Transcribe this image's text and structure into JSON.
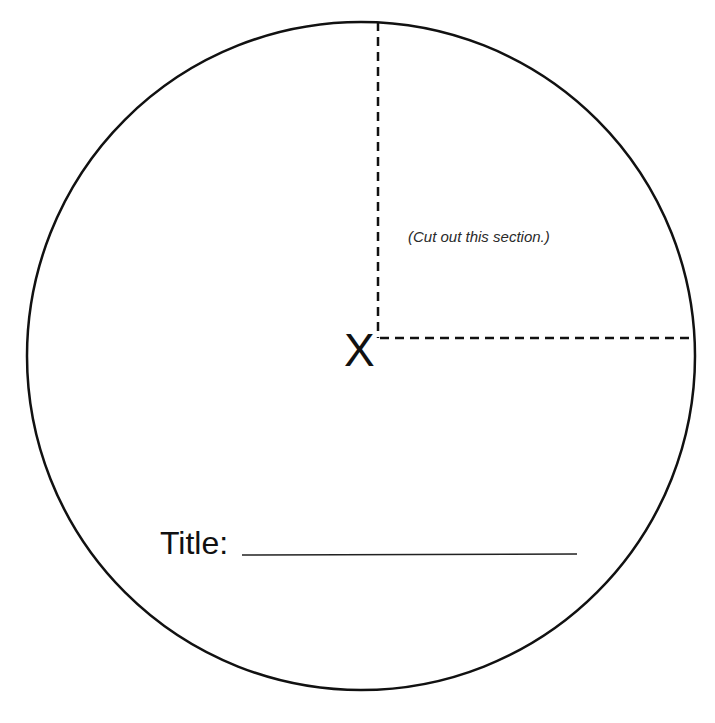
{
  "diagram": {
    "type": "circle-cutout-template",
    "circle": {
      "cx": 361,
      "cy": 356,
      "r": 334,
      "stroke": "#111111",
      "stroke_width": 2.5
    },
    "cut_lines": {
      "vertical": {
        "x": 378,
        "y1": 22,
        "y2": 338
      },
      "horizontal": {
        "y": 338,
        "x1": 380,
        "x2": 695
      },
      "dash": "9,6",
      "stroke": "#111111"
    },
    "cut_note": "(Cut out this section.)",
    "center_mark": "X",
    "title_label": "Title:",
    "title_line": {
      "x1": 242,
      "x2": 577,
      "y": 555
    }
  }
}
